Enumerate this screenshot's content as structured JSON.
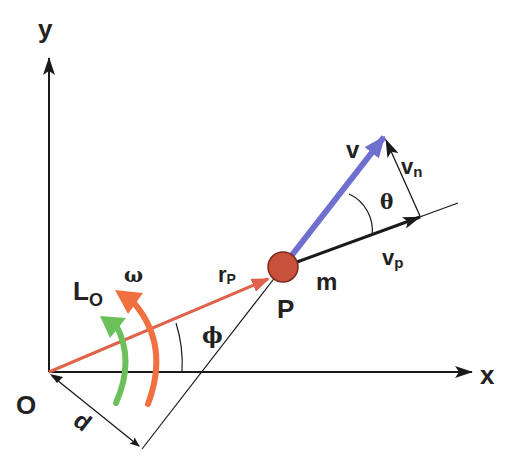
{
  "diagram": {
    "colors": {
      "axes": "#1a1a1a",
      "position_vector": "#e0624a",
      "velocity_vector": "#6f6fcf",
      "mass": "#c9503a",
      "omega_arrow": "#f07040",
      "angular_momentum_arrow": "#6cc05a"
    },
    "labels": {
      "y_axis": "y",
      "x_axis": "x",
      "origin": "O",
      "distance": "d",
      "angular_momentum_main": "L",
      "angular_momentum_sub": "O",
      "omega": "ω",
      "position_main": "r",
      "position_sub": "P",
      "point": "P",
      "mass": "m",
      "velocity": "v",
      "velocity_normal_main": "v",
      "velocity_normal_sub": "n",
      "velocity_parallel_main": "v",
      "velocity_parallel_sub": "p",
      "theta": "θ",
      "phi": "ϕ"
    }
  }
}
